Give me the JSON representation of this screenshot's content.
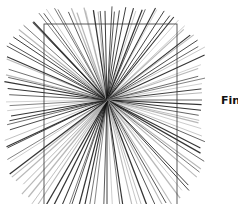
{
  "diagram": {
    "type": "radial-starburst",
    "center": [
      107,
      100
    ],
    "line_count": 120,
    "frame_rect": {
      "x": 44,
      "y": 24,
      "width": 133,
      "height": 190
    },
    "clip_bounds": {
      "left": 4,
      "right": 205,
      "top": 6,
      "bottom": 214,
      "corner_cut": 38
    },
    "colors": {
      "line_dark": "#111111",
      "line_light": "#9a9a9a",
      "frame": "#333333",
      "background": "#ffffff"
    }
  },
  "labels": {
    "fin": "Fin"
  }
}
